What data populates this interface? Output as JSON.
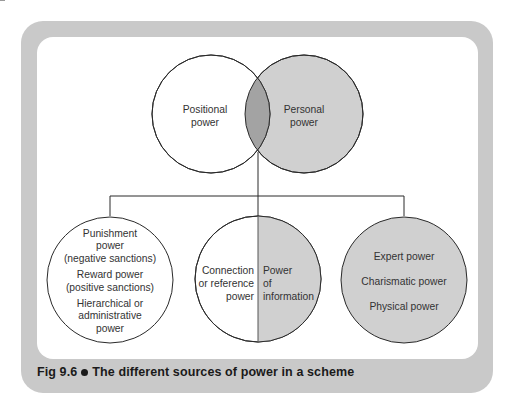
{
  "figure": {
    "number": "Fig 9.6",
    "caption": "The different sources of power in a scheme"
  },
  "venn": {
    "left": {
      "lines": [
        "Positional",
        "power"
      ]
    },
    "right": {
      "lines": [
        "Personal",
        "power"
      ]
    }
  },
  "branches": {
    "left": {
      "groups": [
        [
          "Punishment",
          "power",
          "(negative sanctions)"
        ],
        [
          "Reward power",
          "(positive sanctions)"
        ],
        [
          "Hierarchical or",
          "administrative",
          "power"
        ]
      ]
    },
    "middle": {
      "left_half": [
        "Connection",
        "or reference",
        "power"
      ],
      "right_half": [
        "Power",
        "of",
        "information"
      ]
    },
    "right": {
      "items": [
        "Expert power",
        "Charismatic power",
        "Physical power"
      ]
    }
  },
  "colors": {
    "frame": "#c9c9c9",
    "personal_fill": "#d0d0d0",
    "overlap_fill": "#a3a3a3",
    "stroke": "#2a2a2a"
  }
}
